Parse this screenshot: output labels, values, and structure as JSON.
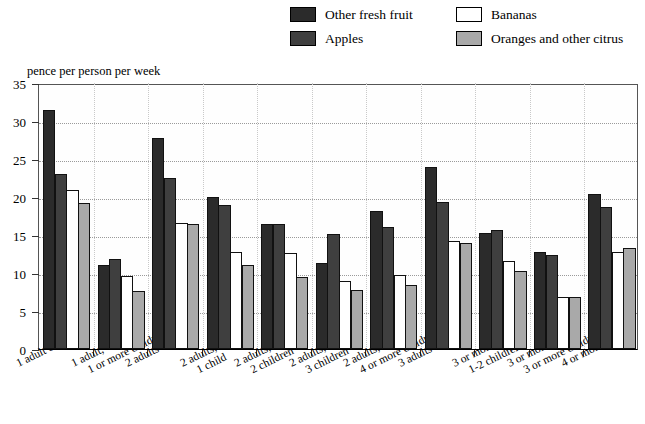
{
  "axis_title": "pence per person per week",
  "legend": [
    {
      "label": "Other fresh fruit",
      "color": "#2b2b2b",
      "key": "other_fresh_fruit"
    },
    {
      "label": "Apples",
      "color": "#3f3f3f",
      "key": "apples"
    },
    {
      "label": "Bananas",
      "color": "#ffffff",
      "key": "bananas"
    },
    {
      "label": "Oranges and other citrus",
      "color": "#a9a9a9",
      "key": "oranges"
    }
  ],
  "yticks": [
    "0",
    "5",
    "10",
    "15",
    "20",
    "25",
    "30",
    "35"
  ],
  "chart_data": {
    "type": "bar",
    "title": "",
    "subtitle": "",
    "xlabel": "",
    "ylabel": "pence per person per week",
    "ylim": [
      0,
      35
    ],
    "ytick_step": 5,
    "grid": true,
    "legend_position": "top",
    "categories": [
      "1 adult only",
      "1 adult,\n1 or more children",
      "2 adults only",
      "2 adults,\n1 child",
      "2 adults,\n2 children",
      "2 adults,\n3 children",
      "2 adults,\n4 or more children",
      "3 adults only",
      "3 or more adults,\n1-2 children",
      "3 or more adults,\n3 or more children",
      "4 or more adults"
    ],
    "categories_lines": [
      [
        "1 adult only",
        ""
      ],
      [
        "1 adult,",
        "1 or more children"
      ],
      [
        "2 adults only",
        ""
      ],
      [
        "2 adults,",
        "1 child"
      ],
      [
        "2 adults,",
        "2 children"
      ],
      [
        "2 adults,",
        "3 children"
      ],
      [
        "2 adults,",
        "4 or more children"
      ],
      [
        "3 adults only",
        ""
      ],
      [
        "3 or more adults,",
        "1-2 children"
      ],
      [
        "3 or more adults,",
        "3 or more children"
      ],
      [
        "4 or more adults",
        ""
      ]
    ],
    "series": [
      {
        "name": "Other fresh fruit",
        "color": "#2b2b2b",
        "values": [
          31.4,
          11.0,
          27.8,
          20.0,
          16.5,
          11.3,
          18.2,
          24.0,
          15.2,
          12.7,
          20.4
        ]
      },
      {
        "name": "Apples",
        "color": "#3f3f3f",
        "values": [
          23.0,
          11.9,
          22.5,
          18.9,
          16.5,
          15.1,
          16.0,
          19.3,
          15.6,
          12.4,
          18.7
        ]
      },
      {
        "name": "Bananas",
        "color": "#ffffff",
        "values": [
          20.9,
          9.6,
          16.6,
          12.7,
          12.6,
          9.0,
          9.7,
          14.2,
          11.6,
          6.9,
          12.8
        ]
      },
      {
        "name": "Oranges and other citrus",
        "color": "#a9a9a9",
        "values": [
          19.2,
          7.6,
          16.5,
          11.0,
          9.5,
          7.8,
          8.4,
          14.0,
          10.2,
          6.9,
          13.3
        ]
      }
    ]
  }
}
